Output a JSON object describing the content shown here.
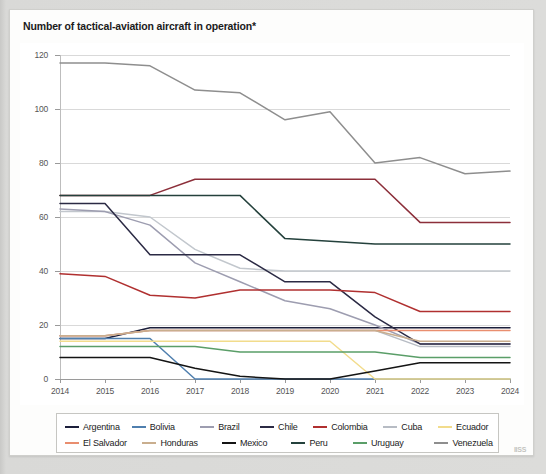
{
  "header": {
    "title": "Number of tactical-aviation aircraft in operation*"
  },
  "footer": {
    "logo_text": "IISS"
  },
  "chart_data": {
    "type": "line",
    "title": "Number of tactical-aviation aircraft in operation*",
    "xlabel": "",
    "ylabel": "",
    "x": [
      2014,
      2015,
      2016,
      2017,
      2018,
      2019,
      2020,
      2021,
      2022,
      2023,
      2024
    ],
    "categories": [
      "2014",
      "2015",
      "2016",
      "2017",
      "2018",
      "2019",
      "2020",
      "2021",
      "2022",
      "2023",
      "2024"
    ],
    "ylim": [
      0,
      120
    ],
    "yticks": [
      0,
      20,
      40,
      60,
      80,
      100,
      120
    ],
    "grid": true,
    "legend_position": "bottom",
    "series": [
      {
        "name": "Argentina",
        "color": "#1c1f3b",
        "values": [
          15,
          15,
          19,
          19,
          19,
          19,
          19,
          19,
          19,
          19,
          19
        ]
      },
      {
        "name": "Bolivia",
        "color": "#4f7fae",
        "values": [
          15,
          15,
          15,
          0,
          0,
          0,
          0,
          0,
          0,
          0,
          0
        ]
      },
      {
        "name": "Brazil",
        "color": "#9d9db0",
        "values": [
          63,
          62,
          57,
          43,
          36,
          29,
          26,
          20,
          13,
          13,
          13
        ]
      },
      {
        "name": "Chile",
        "color": "#2b2a44",
        "values": [
          65,
          65,
          46,
          46,
          46,
          36,
          36,
          23,
          13,
          13,
          13
        ]
      },
      {
        "name": "Colombia",
        "color": "#b03030",
        "values": [
          39,
          38,
          31,
          30,
          33,
          33,
          33,
          32,
          25,
          25,
          25
        ]
      },
      {
        "name": "Cuba",
        "color": "#b7bcc4",
        "values": [
          16,
          16,
          18,
          18,
          18,
          18,
          18,
          18,
          12,
          12,
          12
        ]
      },
      {
        "name": "Ecuador",
        "color": "#f2dc8c",
        "values": [
          14,
          14,
          14,
          14,
          14,
          14,
          14,
          0,
          0,
          0,
          0
        ]
      },
      {
        "name": "El Salvador",
        "color": "#e98e6f",
        "values": [
          16,
          16,
          18,
          18,
          18,
          18,
          18,
          18,
          18,
          18,
          18
        ]
      },
      {
        "name": "Honduras",
        "color": "#c9ae8e",
        "values": [
          16,
          16,
          18,
          18,
          18,
          18,
          18,
          18,
          14,
          14,
          14
        ]
      },
      {
        "name": "Mexico",
        "color": "#141414",
        "values": [
          8,
          8,
          8,
          4,
          1,
          0,
          0,
          3,
          6,
          6,
          6
        ]
      },
      {
        "name": "Peru",
        "color": "#24413c",
        "values": [
          68,
          68,
          68,
          68,
          68,
          52,
          51,
          50,
          50,
          50,
          50
        ]
      },
      {
        "name": "Uruguay",
        "color": "#5a9e68",
        "values": [
          12,
          12,
          12,
          12,
          10,
          10,
          10,
          10,
          8,
          8,
          8
        ]
      },
      {
        "name": "Venezuela",
        "color": "#8e8e8e",
        "values": [
          117,
          117,
          116,
          107,
          106,
          96,
          99,
          80,
          82,
          76,
          77
        ]
      }
    ],
    "overlay_series": [
      {
        "name": "Brazil-upper",
        "color": "#8c2f3a",
        "values": [
          68,
          68,
          68,
          74,
          74,
          74,
          74,
          74,
          58,
          58,
          58
        ]
      },
      {
        "name": "Cuba-upper",
        "color": "#c2c7cd",
        "values": [
          62,
          62,
          60,
          48,
          41,
          40,
          40,
          40,
          40,
          40,
          40
        ]
      }
    ]
  }
}
